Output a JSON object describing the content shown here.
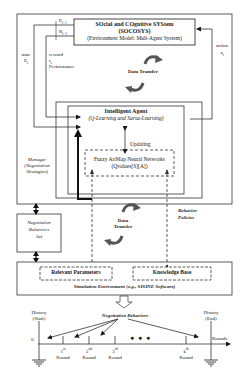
{
  "diagram": {
    "socosys": {
      "line1": "SOcial and COgnitive SYStem",
      "line2": "(SOCOSYS)",
      "line3": "(Environment Model: Muli-Agent System)"
    },
    "feedback": {
      "e_next": "E",
      "e_next_sub": "t+1",
      "r_next": "R",
      "r_next_sub": "t+1",
      "state_label": "state",
      "state_var": "E",
      "state_sub": "t",
      "reward_label": "reward",
      "reward_var": "r",
      "reward_sub": "t",
      "performance_label": "Performance",
      "action_label": "action",
      "action_var": "a",
      "action_sub": "t"
    },
    "data_transfer_top": "Data Transfer",
    "intelligent_agent": {
      "title": "Intelligent Agent",
      "subtitle": "(Q-Learning and Sarsa-Learning)"
    },
    "updating_label": "Updating",
    "fuzzy_artmap": {
      "line1": "Fuzzy ArtMap Neural Networks",
      "line2": "(Qvalues[S][A])"
    },
    "manager": {
      "line1": "Manager",
      "line2": "(Negotiation",
      "line3": "Strategies)"
    },
    "negotiation_behaviors_set": {
      "line1": "Negotiation",
      "line2": "Behaviors",
      "line3": "Set"
    },
    "data_transfer_bottom": {
      "line1": "Data",
      "line2": "Transfer"
    },
    "behavior_policies": {
      "line1": "Behavior",
      "line2": "Policies"
    },
    "simulation": {
      "relevant_parameters": "Relevant Parameters",
      "knowledge_base": "Knowledge Base",
      "caption": "Simulation Environment (e.g., SISINE Software)"
    },
    "timeline": {
      "negotiation_behaviors": "Negotiation Behaviors",
      "history_start_1": "History",
      "history_start_2": "(Start)",
      "history_end_1": "History",
      "history_end_2": "(End)",
      "zero": "0",
      "rounds_axis": "Rounds",
      "ellipsis": "● ● ●",
      "rounds": [
        {
          "num": "1",
          "sup": "st",
          "label": "Round"
        },
        {
          "num": "2",
          "sup": "nd",
          "label": "Round"
        },
        {
          "num": "3",
          "sup": "rd",
          "label": "Round"
        },
        {
          "num": "k",
          "sup": "th",
          "label": "Round"
        }
      ]
    }
  }
}
